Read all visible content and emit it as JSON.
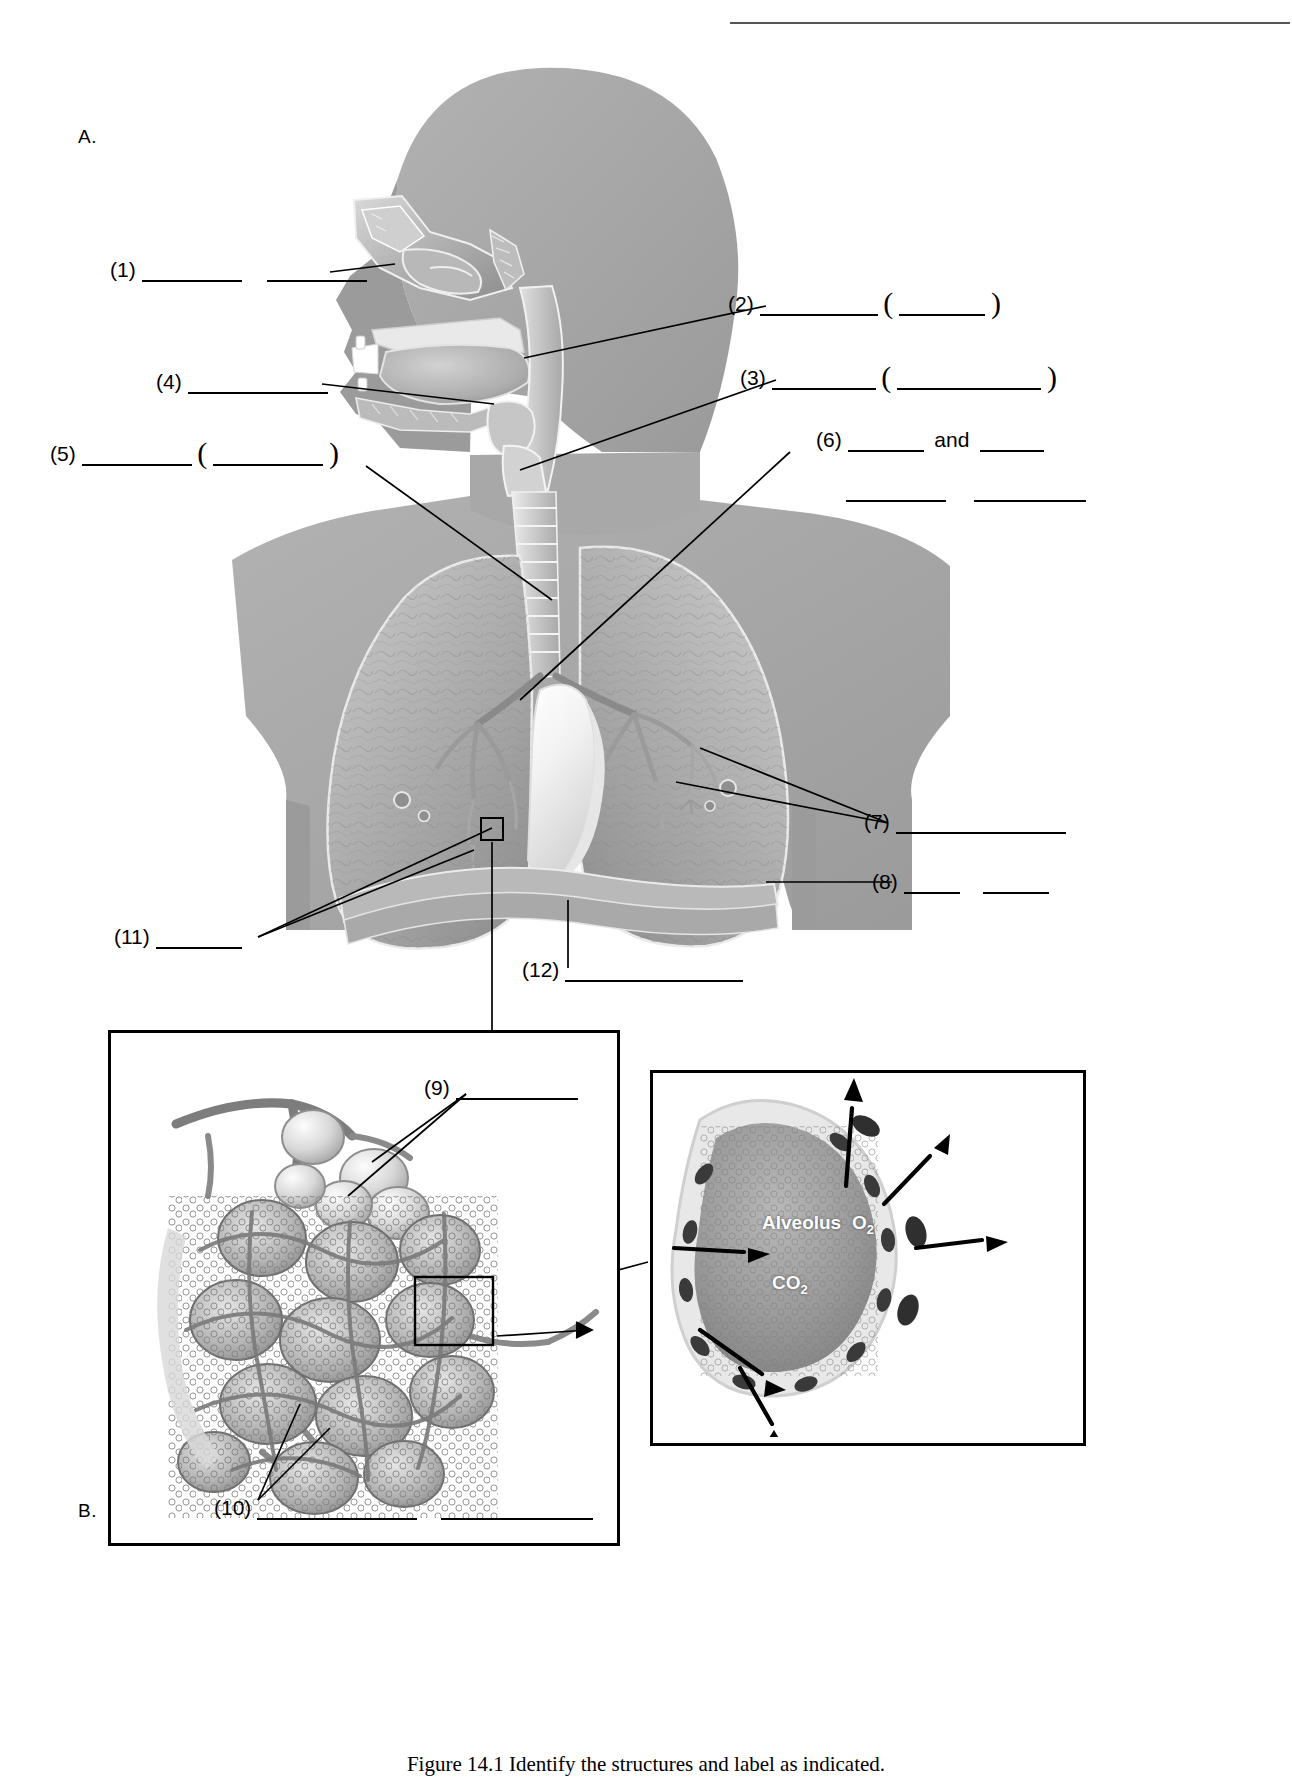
{
  "document": {
    "figure_a_letter": "A.",
    "figure_b_letter": "B.",
    "caption": "Figure 14.1  Identify the structures and label as indicated."
  },
  "labels": [
    {
      "id": "1",
      "num": "(1)",
      "blanks": 2,
      "pattern": "blank blank"
    },
    {
      "id": "2",
      "num": "(2)",
      "blanks": 2,
      "pattern": "blank paren-open blank paren-close"
    },
    {
      "id": "3",
      "num": "(3)",
      "blanks": 2,
      "pattern": "blank paren-open blank paren-close"
    },
    {
      "id": "4",
      "num": "(4)",
      "blanks": 1,
      "pattern": "blank"
    },
    {
      "id": "5",
      "num": "(5)",
      "blanks": 2,
      "pattern": "blank paren-open blank paren-close"
    },
    {
      "id": "6",
      "num": "(6)",
      "blanks": 4,
      "pattern": "blank and blank / blank blank",
      "conjunction": "and"
    },
    {
      "id": "7",
      "num": "(7)",
      "blanks": 1,
      "pattern": "blank"
    },
    {
      "id": "8",
      "num": "(8)",
      "blanks": 2,
      "pattern": "blank blank"
    },
    {
      "id": "9",
      "num": "(9)",
      "blanks": 1,
      "pattern": "blank"
    },
    {
      "id": "10",
      "num": "(10)",
      "blanks": 2,
      "pattern": "blank blank"
    },
    {
      "id": "11",
      "num": "(11)",
      "blanks": 1,
      "pattern": "blank"
    },
    {
      "id": "12",
      "num": "(12)",
      "blanks": 1,
      "pattern": "blank"
    }
  ],
  "inset_detail": {
    "alveolus_label": "Alveolus",
    "oxygen_label": "O",
    "oxygen_sub": "2",
    "carbon_dioxide_label": "CO",
    "carbon_dioxide_sub": "2"
  }
}
